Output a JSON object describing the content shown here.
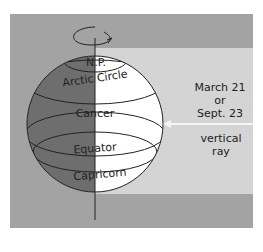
{
  "diagram": {
    "globe_labels": {
      "pole": "N.P.",
      "arctic": "Arctic Circle",
      "cancer": "Cancer",
      "equator": "Equator",
      "capricorn": "Capricorn"
    },
    "date_label": {
      "line1": "March 21",
      "line2": "or",
      "line3": "Sept. 23"
    },
    "ray_label": "vertical ray",
    "colors": {
      "frame": "#a3a3a3",
      "sunlight_band": "#d4d4d4",
      "night_side": "#6e6e6e",
      "day_side": "#ffffff",
      "lines": "#222222"
    }
  }
}
